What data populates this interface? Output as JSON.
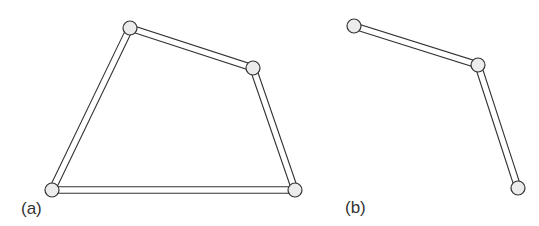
{
  "figure": {
    "panels": [
      {
        "label": "(a)",
        "type": "closed-four-bar-linkage",
        "joints": [
          [
            130,
            28
          ],
          [
            253,
            68
          ],
          [
            295,
            190
          ],
          [
            52,
            190
          ]
        ],
        "links": [
          [
            0,
            1
          ],
          [
            1,
            2
          ],
          [
            2,
            3
          ],
          [
            3,
            0
          ]
        ]
      },
      {
        "label": "(b)",
        "type": "open-two-link-chain",
        "joints": [
          [
            354,
            26
          ],
          [
            478,
            65
          ],
          [
            518,
            188
          ]
        ],
        "links": [
          [
            0,
            1
          ],
          [
            1,
            2
          ]
        ]
      }
    ],
    "colors": {
      "stroke": "#333333",
      "joint_fill": "#ececec",
      "link_fill": "#ffffff"
    }
  }
}
